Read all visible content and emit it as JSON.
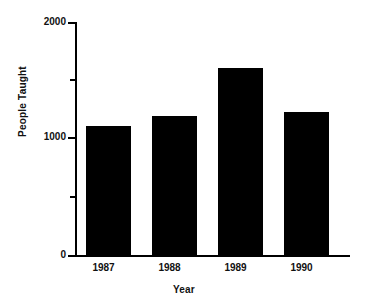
{
  "chart_data": {
    "type": "bar",
    "title": "",
    "categories": [
      "1987",
      "1988",
      "1989",
      "1990"
    ],
    "values": [
      1110,
      1195,
      1605,
      1230
    ],
    "series": [
      {
        "name": "People Taught",
        "values": [
          1110,
          1195,
          1605,
          1230
        ]
      }
    ],
    "xlabel": "Year",
    "ylabel": "People Taught",
    "ylim": [
      0,
      2000
    ],
    "ytick_labels": [
      "0",
      "1000",
      "2000"
    ],
    "ytick_values": [
      0,
      1000,
      2000
    ],
    "yminor_tick_values": [
      500,
      1500
    ],
    "grid": false,
    "legend": false,
    "bar_color": "#000000"
  },
  "axes": {
    "y_title": "People Taught",
    "x_title": "Year",
    "y_labels": [
      "2000",
      "1000",
      "0"
    ]
  },
  "colors": {
    "bar": "#000000",
    "axis": "#000000",
    "text": "#111111",
    "background": "#ffffff"
  }
}
